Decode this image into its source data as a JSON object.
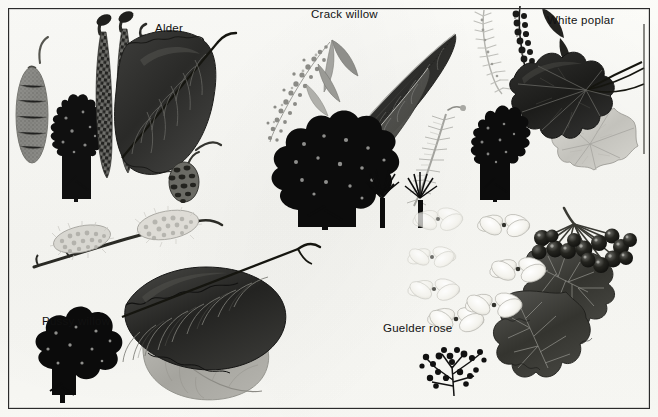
{
  "plate": {
    "title": "Tree and shrub identification plate",
    "background_color": "#fbfbf8",
    "frame_color": "#2b2b2b",
    "width": 658,
    "height": 417,
    "style": "monochrome greyscale botanical illustration"
  },
  "labels": [
    {
      "id": "alder",
      "text": "Alder",
      "x": 155,
      "y": 22
    },
    {
      "id": "crack-willow",
      "text": "Crack willow",
      "x": 311,
      "y": 8
    },
    {
      "id": "white-poplar",
      "text": "White poplar",
      "x": 547,
      "y": 14
    },
    {
      "id": "pussy-willow",
      "text": "Pussy willow",
      "x": 42,
      "y": 315
    },
    {
      "id": "guelder-rose",
      "text": "Guelder rose",
      "x": 383,
      "y": 322
    }
  ],
  "species": [
    {
      "id": "alder",
      "name": "Alder",
      "parts": [
        {
          "part": "female-catkin",
          "tone": "mid-grey",
          "shape": "oblong stippled catkin on curved stalk"
        },
        {
          "part": "tree-silhouette",
          "tone": "black",
          "shape": "conical crown"
        },
        {
          "part": "male-catkins",
          "tone": "dark-grey",
          "shape": "two long pendulous scaled catkins"
        },
        {
          "part": "leaf",
          "tone": "very-dark",
          "shape": "broad rounded leaf, notched apex, pinnate veins"
        },
        {
          "part": "cone",
          "tone": "mid-grey",
          "shape": "small woody cone on stalk"
        }
      ]
    },
    {
      "id": "crack-willow",
      "name": "Crack willow",
      "parts": [
        {
          "part": "catkin-stippled",
          "tone": "light-grey",
          "shape": "fluffy speckled catkin with small leaves"
        },
        {
          "part": "leaf-large",
          "tone": "very-dark",
          "shape": "long lanceolate leaf, fine serrations"
        },
        {
          "part": "leaf-second",
          "tone": "dark-grey",
          "shape": "long lanceolate leaf"
        },
        {
          "part": "catkin-feathery",
          "tone": "light-grey",
          "shape": "narrow feathery catkin"
        },
        {
          "part": "tree-silhouette",
          "tone": "black",
          "shape": "broad rounded crown on short trunk"
        },
        {
          "part": "pollard-pair",
          "tone": "black",
          "shape": "two small pollarded willows"
        }
      ]
    },
    {
      "id": "white-poplar",
      "name": "White poplar",
      "parts": [
        {
          "part": "catkin-pale",
          "tone": "light-grey",
          "shape": "silvery pendulous catkin"
        },
        {
          "part": "catkin-dark",
          "tone": "very-dark",
          "shape": "knobbly dark pendulous catkin"
        },
        {
          "part": "leaf-upper",
          "tone": "very-dark",
          "shape": "lobed maple-like leaf, dark upper surface"
        },
        {
          "part": "leaf-underside",
          "tone": "pale-grey",
          "shape": "lobed leaf showing white felted underside"
        },
        {
          "part": "tree-silhouette",
          "tone": "black",
          "shape": "narrow conical crown"
        }
      ]
    },
    {
      "id": "pussy-willow",
      "name": "Pussy willow",
      "parts": [
        {
          "part": "catkins-twig",
          "tone": "light-grey",
          "shape": "two furry pale catkins on dark twig"
        },
        {
          "part": "leaf-upper",
          "tone": "very-dark",
          "shape": "large oval leaf, strong parallel veins"
        },
        {
          "part": "leaf-underside",
          "tone": "mid-grey",
          "shape": "pale veined leaf underside"
        },
        {
          "part": "tree-silhouette",
          "tone": "black",
          "shape": "rounded bushy crown"
        }
      ]
    },
    {
      "id": "guelder-rose",
      "name": "Guelder rose",
      "parts": [
        {
          "part": "flowers",
          "tone": "white",
          "shape": "flat heads of white four-petalled sterile flowers"
        },
        {
          "part": "berries",
          "tone": "black",
          "shape": "drooping cluster of round berries"
        },
        {
          "part": "leaf-lobed",
          "tone": "dark-grey",
          "shape": "three-lobed maple-like toothed leaf"
        },
        {
          "part": "shrub-silhouette",
          "tone": "black",
          "shape": "sparse twiggy shrub"
        }
      ]
    }
  ]
}
